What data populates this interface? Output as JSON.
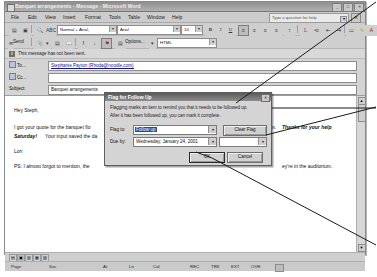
{
  "window": {
    "title": "Banquet arrangements - Message - Microsoft Word",
    "app_icon": "word-icon",
    "minimize": "_",
    "maximize": "□",
    "close": "✕"
  },
  "menubar": {
    "items": [
      "File",
      "Edit",
      "View",
      "Insert",
      "Format",
      "Tools",
      "Table",
      "Window",
      "Help"
    ],
    "help_box_placeholder": "Type a question for help",
    "help_box_arrow": "▾",
    "doc_close": "✕"
  },
  "formatting_toolbar": {
    "style_value": "Normal + Arial,",
    "font_value": "Arial",
    "size_value": "10",
    "buttons": [
      {
        "name": "save-button",
        "glyph": "▤"
      },
      {
        "name": "print-button",
        "glyph": "▣"
      },
      {
        "name": "print-preview-button",
        "glyph": "🔍"
      },
      {
        "name": "spelling-button",
        "glyph": "ABC"
      },
      {
        "name": "bold-button",
        "glyph": "B"
      },
      {
        "name": "italic-button",
        "glyph": "I"
      },
      {
        "name": "underline-button",
        "glyph": "U"
      },
      {
        "name": "align-left-button",
        "glyph": "≡"
      },
      {
        "name": "align-center-button",
        "glyph": "≡"
      },
      {
        "name": "align-right-button",
        "glyph": "≡"
      },
      {
        "name": "justify-button",
        "glyph": "≡"
      },
      {
        "name": "line-spacing-button",
        "glyph": "↕"
      },
      {
        "name": "numbered-list-button",
        "glyph": "⒈"
      },
      {
        "name": "bulleted-list-button",
        "glyph": "•≡"
      },
      {
        "name": "decrease-indent-button",
        "glyph": "⇤"
      },
      {
        "name": "increase-indent-button",
        "glyph": "⇥"
      },
      {
        "name": "borders-button",
        "glyph": "▭"
      },
      {
        "name": "highlight-button",
        "glyph": "✎"
      },
      {
        "name": "font-color-button",
        "glyph": "A"
      }
    ]
  },
  "email_toolbar": {
    "send_label": "Send",
    "options_label": "Options...",
    "format_value": "HTML",
    "buttons": [
      {
        "name": "attach-file-button",
        "glyph": "📎"
      },
      {
        "name": "insert-item-button",
        "glyph": "▤"
      },
      {
        "name": "address-book-button",
        "glyph": "📖"
      },
      {
        "name": "check-names-button",
        "glyph": "✓"
      },
      {
        "name": "importance-high-button",
        "glyph": "!"
      },
      {
        "name": "importance-low-button",
        "glyph": "↓"
      },
      {
        "name": "flag-for-follow-up-button",
        "glyph": "⚑"
      }
    ]
  },
  "infobar": {
    "icon": "info-icon",
    "icon_glyph": "i",
    "text": "This message has not been sent."
  },
  "header_fields": [
    {
      "name": "to",
      "button_label": "To...",
      "value": "Stephanie Payton (Rhoda@noodle.com)",
      "is_link": true
    },
    {
      "name": "cc",
      "button_label": "Cc...",
      "value": "",
      "is_link": true
    },
    {
      "name": "subject",
      "button_label": "Subject:",
      "value": "Banquet arrangements",
      "is_link": false
    }
  ],
  "message_body": {
    "greeting": "Hey Steph,",
    "para1_start": "I got your quote for the banquet flo",
    "para1_mid": "rnoon.",
    "para1_bold": "Thanks for your help",
    "para2_bold": "Saturday!",
    "para2_rest": "Your input saved the da",
    "signature": "Lori",
    "postscript": "PS: I almost forgot to mention, the",
    "postscript_tail": "ey're in the auditorium."
  },
  "dialog": {
    "title": "Flag for Follow Up",
    "close_glyph": "✕",
    "description_line1": "Flagging marks an item to remind you that it needs to be followed up.",
    "description_line2": "After it has been followed up, you can mark it complete.",
    "flag_to_label": "Flag to:",
    "flag_to_value": "Follow up",
    "clear_flag_label": "Clear Flag",
    "due_by_label": "Due by:",
    "due_by_value": "Wednesday, January 24, 2001",
    "due_time_value": "",
    "ok_label": "OK",
    "cancel_label": "Cancel",
    "dropdown_arrow": "▾"
  },
  "view_bar": {
    "buttons": [
      {
        "name": "normal-view-button",
        "glyph": "▤"
      },
      {
        "name": "web-layout-view-button",
        "glyph": "▣"
      },
      {
        "name": "print-layout-view-button",
        "glyph": "▥"
      },
      {
        "name": "outline-view-button",
        "glyph": "▦"
      },
      {
        "name": "reading-view-button",
        "glyph": "▧"
      }
    ]
  },
  "status_bar": {
    "page_label": "Page",
    "sec_label": "Sec",
    "at_label": "At",
    "ln_label": "Ln",
    "col_label": "Col",
    "rec_label": "REC",
    "trk_label": "TRK",
    "ext_label": "EXT",
    "ovr_label": "OVR",
    "spell_icon": "spell-check-icon"
  },
  "scrollbar": {
    "up_arrow": "▲",
    "down_arrow": "▼"
  },
  "colors": {
    "window_chrome": "#cfcfcf",
    "title_bar": "#8f8f8f",
    "dialog_title": "#5a5a5a",
    "link_text": "#11119a",
    "selection": "#2b4b8f"
  }
}
